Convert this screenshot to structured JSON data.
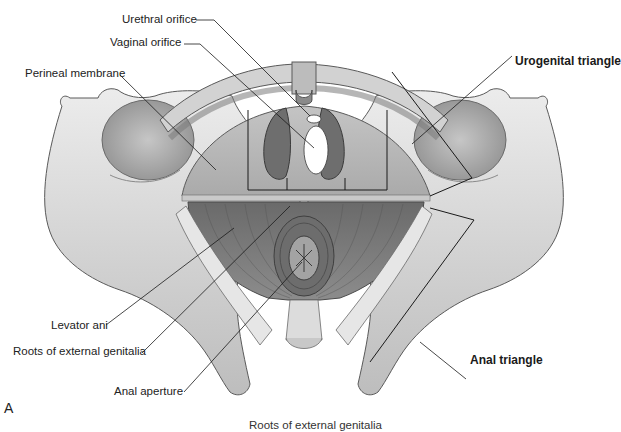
{
  "figure": {
    "panel_letter": "A",
    "caption_partial": "Roots of external genitalia"
  },
  "labels": {
    "urethral_orifice": "Urethral orifice",
    "vaginal_orifice": "Vaginal orifice",
    "perineal_membrane": "Perineal membrane",
    "urogenital_triangle": "Urogenital triangle",
    "levator_ani": "Levator ani",
    "roots_external_genitalia": "Roots of external genitalia",
    "anal_aperture": "Anal aperture",
    "anal_triangle": "Anal triangle"
  },
  "colors": {
    "background": "#ffffff",
    "bone": "#d9d9d9",
    "bone_shadow": "#a9a9a9",
    "membrane": "#b5b5b5",
    "muscle": "#7e7e7e",
    "leader_line": "#1a1a1a"
  }
}
